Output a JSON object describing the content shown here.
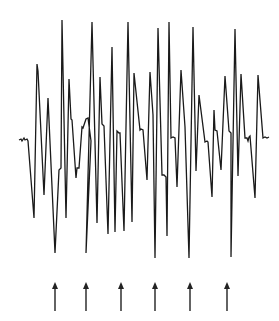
{
  "figure": {
    "type": "waveform-trace",
    "colors": {
      "background": "#ffffff",
      "trace": "#1a1a1a",
      "arrows": "#222222"
    },
    "trace_points": [
      [
        19,
        140
      ],
      [
        21,
        139
      ],
      [
        22,
        141
      ],
      [
        24,
        138
      ],
      [
        25,
        140
      ],
      [
        27,
        139
      ],
      [
        28,
        141
      ],
      [
        34,
        218
      ],
      [
        37,
        64
      ],
      [
        38,
        71
      ],
      [
        44,
        195
      ],
      [
        48,
        98
      ],
      [
        55,
        253
      ],
      [
        59,
        170
      ],
      [
        61,
        168
      ],
      [
        62,
        20
      ],
      [
        66,
        218
      ],
      [
        69,
        79
      ],
      [
        71,
        119
      ],
      [
        72,
        120
      ],
      [
        76,
        178
      ],
      [
        77,
        168
      ],
      [
        79,
        168
      ],
      [
        82,
        127
      ],
      [
        83,
        128
      ],
      [
        86,
        119
      ],
      [
        88,
        118
      ],
      [
        91,
        141
      ],
      [
        86,
        253
      ],
      [
        92,
        22
      ],
      [
        97,
        223
      ],
      [
        100,
        77
      ],
      [
        102,
        124
      ],
      [
        104,
        126
      ],
      [
        108,
        234
      ],
      [
        112,
        47
      ],
      [
        115,
        232
      ],
      [
        117,
        131
      ],
      [
        119,
        133
      ],
      [
        120,
        133
      ],
      [
        124,
        231
      ],
      [
        128,
        22
      ],
      [
        132,
        222
      ],
      [
        134,
        73
      ],
      [
        140,
        130
      ],
      [
        141,
        129
      ],
      [
        143,
        130
      ],
      [
        147,
        180
      ],
      [
        150,
        72
      ],
      [
        153,
        115
      ],
      [
        155,
        258
      ],
      [
        158,
        28
      ],
      [
        162,
        175
      ],
      [
        164,
        175
      ],
      [
        166,
        177
      ],
      [
        167,
        236
      ],
      [
        169,
        22
      ],
      [
        171,
        138
      ],
      [
        173,
        137
      ],
      [
        175,
        138
      ],
      [
        177,
        187
      ],
      [
        181,
        70
      ],
      [
        185,
        127
      ],
      [
        189,
        258
      ],
      [
        193,
        27
      ],
      [
        196,
        171
      ],
      [
        199,
        95
      ],
      [
        205,
        142
      ],
      [
        207,
        141
      ],
      [
        208,
        142
      ],
      [
        212,
        197
      ],
      [
        214,
        110
      ],
      [
        215,
        130
      ],
      [
        217,
        131
      ],
      [
        221,
        170
      ],
      [
        225,
        76
      ],
      [
        229,
        131
      ],
      [
        231,
        133
      ],
      [
        231,
        257
      ],
      [
        235,
        29
      ],
      [
        238,
        176
      ],
      [
        241,
        74
      ],
      [
        245,
        138
      ],
      [
        247,
        138
      ],
      [
        248,
        141
      ],
      [
        249,
        137
      ],
      [
        250,
        136
      ],
      [
        255,
        198
      ],
      [
        258,
        75
      ],
      [
        263,
        138
      ],
      [
        265,
        137
      ],
      [
        267,
        138
      ],
      [
        269,
        137
      ]
    ],
    "arrows": [
      {
        "x": 55,
        "y_tip": 282,
        "y_tail": 311
      },
      {
        "x": 86,
        "y_tip": 282,
        "y_tail": 311
      },
      {
        "x": 121,
        "y_tip": 282,
        "y_tail": 311
      },
      {
        "x": 155,
        "y_tip": 282,
        "y_tail": 311
      },
      {
        "x": 190,
        "y_tip": 282,
        "y_tail": 311
      },
      {
        "x": 227,
        "y_tip": 282,
        "y_tail": 311
      }
    ],
    "arrow_count": 6,
    "arrow_direction": "up"
  }
}
